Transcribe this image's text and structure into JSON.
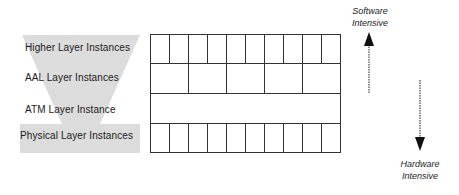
{
  "diagram": {
    "layers": [
      {
        "label": "Higher Layer Instances",
        "cells": 10
      },
      {
        "label": "AAL Layer Instances",
        "cells": 5
      },
      {
        "label": "ATM Layer Instance",
        "cells": 1
      },
      {
        "label": "Physical Layer Instances",
        "cells": 10
      }
    ],
    "top_arrow": {
      "line1": "Software",
      "line2": "Intensive",
      "direction": "up"
    },
    "bottom_arrow": {
      "line1": "Hardware",
      "line2": "Intensive",
      "direction": "down"
    },
    "colors": {
      "funnel": "#d9d9d9",
      "grid_line": "#333333",
      "arrow": "#111111"
    }
  }
}
